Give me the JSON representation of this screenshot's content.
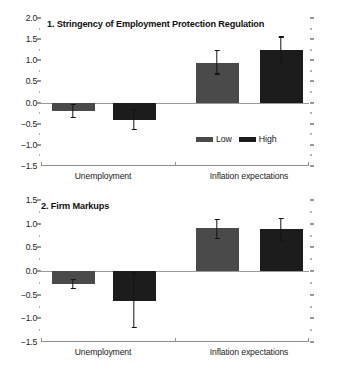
{
  "chart_data": [
    {
      "type": "bar",
      "panel": "1",
      "title": "1. Stringency of Employment Protection Regulation",
      "xlabel": "",
      "ylabel": "",
      "categories": [
        "Unemployment",
        "Inflation expectations"
      ],
      "ylim": [
        -1.5,
        2.0
      ],
      "ytick_labels": [
        "2.0",
        "1.5",
        "1.0",
        "0.5",
        "0.0",
        "-0.5",
        "-1.0",
        "-1.5"
      ],
      "ytick_values": [
        2.0,
        1.5,
        1.0,
        0.5,
        0.0,
        -0.5,
        -1.0,
        -1.5
      ],
      "ytick_minor_values": [
        1.75,
        1.25,
        0.75,
        0.25,
        -0.25,
        -0.75,
        -1.25
      ],
      "grid": false,
      "legend_position": "inside-right",
      "series": [
        {
          "name": "Low",
          "color": "#4a4a4a",
          "values": [
            -0.19,
            0.94
          ],
          "err_low": [
            -0.37,
            0.66
          ],
          "err_high": [
            -0.03,
            1.25
          ]
        },
        {
          "name": "High",
          "color": "#1c1c1c",
          "values": [
            -0.41,
            1.24
          ],
          "err_low": [
            -0.65,
            0.91
          ],
          "err_high": [
            -0.16,
            1.57
          ]
        }
      ]
    },
    {
      "type": "bar",
      "panel": "2",
      "title": "2. Firm Markups",
      "xlabel": "",
      "ylabel": "",
      "categories": [
        "Unemployment",
        "Inflation expectations"
      ],
      "ylim": [
        -1.5,
        1.5
      ],
      "ytick_labels": [
        "1.5",
        "1.0",
        "0.5",
        "0.0",
        "-0.5",
        "-1.0",
        "-1.5"
      ],
      "ytick_values": [
        1.5,
        1.0,
        0.5,
        0.0,
        -0.5,
        -1.0,
        -1.5
      ],
      "ytick_minor_values": [
        1.25,
        0.75,
        0.25,
        -0.25,
        -0.75,
        -1.25
      ],
      "grid": false,
      "legend_position": "inside-right",
      "series": [
        {
          "name": "Low",
          "color": "#4a4a4a",
          "values": [
            -0.27,
            0.91
          ],
          "err_low": [
            -0.39,
            0.67
          ],
          "err_high": [
            -0.17,
            1.1
          ]
        },
        {
          "name": "High",
          "color": "#1c1c1c",
          "values": [
            -0.64,
            0.88
          ],
          "err_low": [
            -1.21,
            0.63
          ],
          "err_high": [
            -0.03,
            1.13
          ]
        }
      ]
    }
  ],
  "legend": {
    "low_label": "Low",
    "high_label": "High"
  },
  "colors": {
    "low": "#4a4a4a",
    "high": "#1c1c1c",
    "axis": "#8f8f8f",
    "zero": "#9a9a9a",
    "text": "#222222"
  }
}
